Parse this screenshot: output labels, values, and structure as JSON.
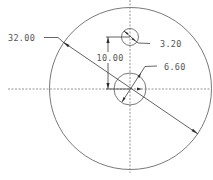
{
  "drawing": {
    "type": "engineering-drawing",
    "view": "front",
    "colors": {
      "background": "#ffffff",
      "geometry": "#6a6a6a",
      "dimension": "#3a3a3a",
      "text": "#555555"
    },
    "features": {
      "outer_circle": {
        "diameter_label": "32.00"
      },
      "top_hole": {
        "diameter_label": "3.20"
      },
      "center_hole": {
        "diameter_label": "6.60"
      },
      "hole_spacing": {
        "label": "10.00"
      }
    }
  }
}
